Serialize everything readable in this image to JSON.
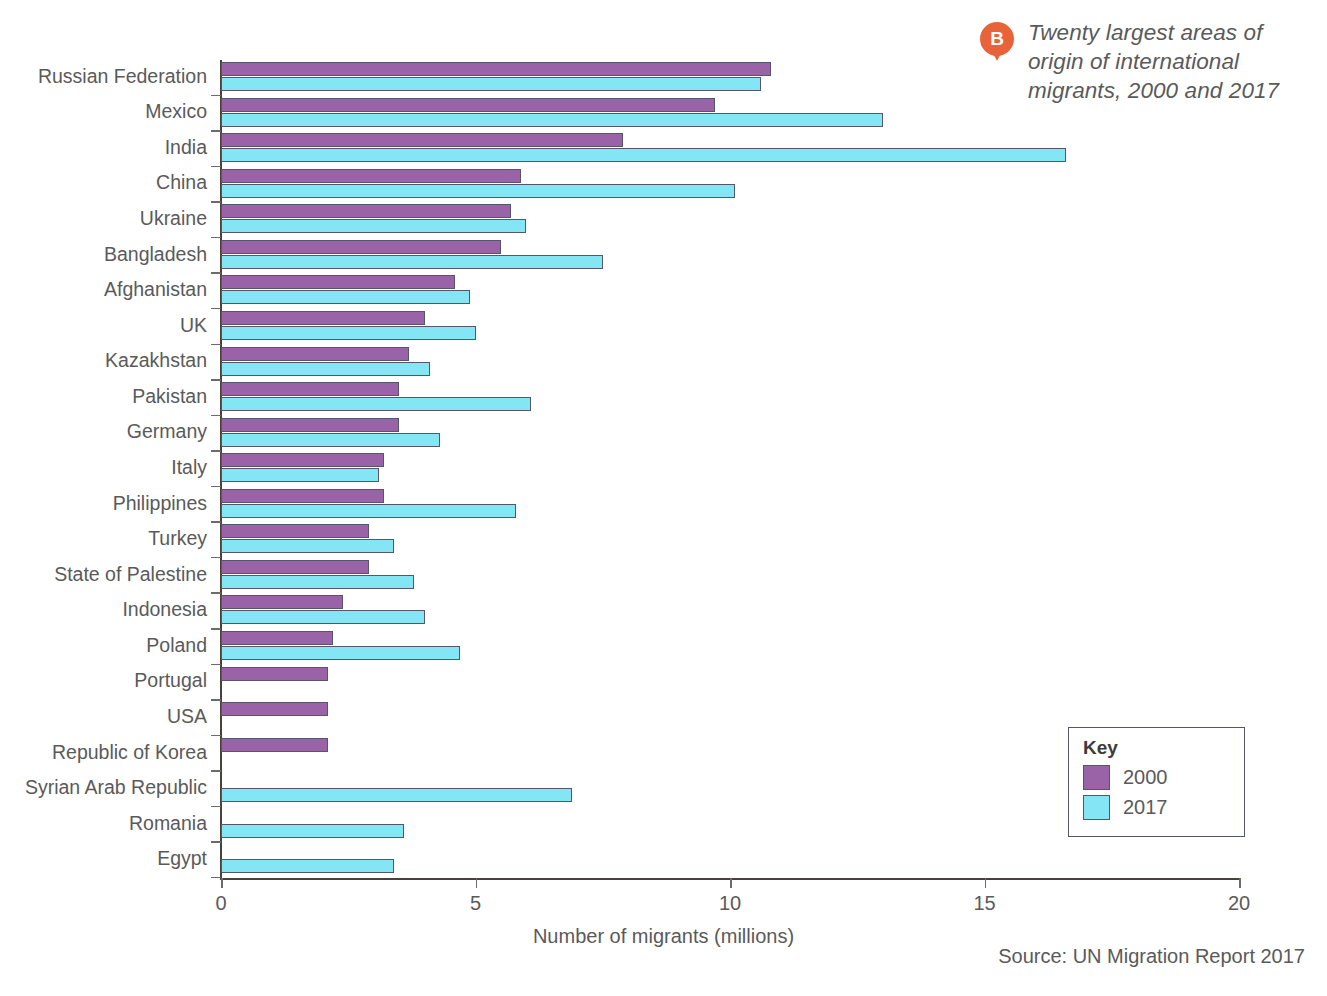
{
  "title": {
    "badge_letter": "B",
    "text": "Twenty largest areas of origin of international migrants, 2000 and 2017"
  },
  "source": "Source: UN Migration Report 2017",
  "key": {
    "heading": "Key",
    "entries": [
      {
        "label": "2000",
        "color": "#9a62a7"
      },
      {
        "label": "2017",
        "color": "#84e6f4"
      }
    ]
  },
  "axis": {
    "x_title": "Number of migrants (millions)",
    "x_ticks": [
      "0",
      "5",
      "10",
      "15",
      "20"
    ]
  },
  "chart_data": {
    "type": "bar",
    "orientation": "horizontal",
    "title": "Twenty largest areas of origin of international migrants, 2000 and 2017",
    "xlabel": "Number of migrants (millions)",
    "ylabel": "",
    "xlim": [
      0,
      20
    ],
    "xticks": [
      0,
      5,
      10,
      15,
      20
    ],
    "grid": false,
    "legend_position": "bottom-right",
    "categories": [
      "Russian Federation",
      "Mexico",
      "India",
      "China",
      "Ukraine",
      "Bangladesh",
      "Afghanistan",
      "UK",
      "Kazakhstan",
      "Pakistan",
      "Germany",
      "Italy",
      "Philippines",
      "Turkey",
      "State of Palestine",
      "Indonesia",
      "Poland",
      "Portugal",
      "USA",
      "Republic of Korea",
      "Syrian Arab Republic",
      "Romania",
      "Egypt"
    ],
    "series": [
      {
        "name": "2000",
        "color": "#9a62a7",
        "values": [
          10.8,
          9.7,
          7.9,
          5.9,
          5.7,
          5.5,
          4.6,
          4.0,
          3.7,
          3.5,
          3.5,
          3.2,
          3.2,
          2.9,
          2.9,
          2.4,
          2.2,
          2.1,
          2.1,
          2.1,
          null,
          null,
          null
        ]
      },
      {
        "name": "2017",
        "color": "#84e6f4",
        "values": [
          10.6,
          13.0,
          16.6,
          10.1,
          6.0,
          7.5,
          4.9,
          5.0,
          4.1,
          6.1,
          4.3,
          3.1,
          5.8,
          3.4,
          3.8,
          4.0,
          4.7,
          null,
          null,
          null,
          6.9,
          3.6,
          3.4
        ]
      }
    ]
  }
}
